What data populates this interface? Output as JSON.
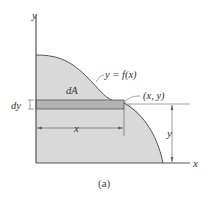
{
  "figure": {
    "caption": "(a)",
    "axes": {
      "x_label": "x",
      "y_label": "y"
    },
    "curve_label": "y = f(x)",
    "element_label": "dA",
    "point_label": "(x, y)",
    "strip_thickness_label": "dy",
    "horizontal_dimension_label": "x",
    "vertical_dimension_label": "y",
    "colors": {
      "region_fill": "#d9d9d9",
      "strip_fill": "#b3b3b3",
      "lines": "#555555"
    }
  }
}
